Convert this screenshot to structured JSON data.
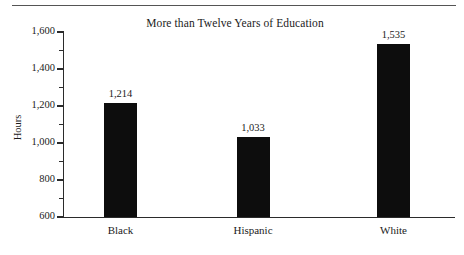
{
  "chart_data": {
    "type": "bar",
    "title": "More than Twelve Years of Education",
    "xlabel": "",
    "ylabel": "Hours",
    "categories": [
      "Black",
      "Hispanic",
      "White"
    ],
    "values": [
      1214,
      1033,
      1535
    ],
    "value_labels": [
      "1,214",
      "1,033",
      "1,535"
    ],
    "ylim": [
      600,
      1600
    ],
    "ytick_labels": [
      "1,600",
      "1,400",
      "1,200",
      "1,000",
      "800",
      "600"
    ],
    "ytick_values": [
      1600,
      1400,
      1200,
      1000,
      800,
      600
    ],
    "yminor_values": [
      1500,
      1300,
      1100,
      900,
      700
    ],
    "grid": false,
    "legend": "none",
    "bar_color": "#0d0d0d",
    "axis_color": "#2b2b2b"
  },
  "figure": {
    "top_rule": true
  }
}
